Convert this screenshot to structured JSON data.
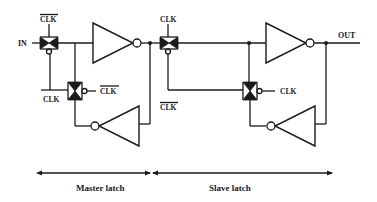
{
  "diagram": {
    "signals": {
      "input": "IN",
      "output": "OUT",
      "clk": "CLK",
      "clk_bar": "CLK"
    },
    "labels": {
      "tg1_clock": "CLK",
      "tg2_clock_left": "CLK",
      "tg2_clock_right": "CLK",
      "tg3_clock": "CLK",
      "tg3_clock_bar": "CLK",
      "tg4_clock": "CLK"
    },
    "sections": [
      {
        "label": "Master latch"
      },
      {
        "label": "Slave latch"
      }
    ],
    "components": [
      {
        "type": "transmission-gate",
        "id": "tg-master-input",
        "control": "CLK_bar (top) / CLK (bottom)"
      },
      {
        "type": "inverter",
        "id": "inv-master-forward"
      },
      {
        "type": "inverter",
        "id": "inv-master-feedback"
      },
      {
        "type": "transmission-gate",
        "id": "tg-master-feedback",
        "control": "CLK (left) / CLK_bar (right)"
      },
      {
        "type": "transmission-gate",
        "id": "tg-slave-input",
        "control": "CLK (top) / CLK_bar (bottom)"
      },
      {
        "type": "inverter",
        "id": "inv-slave-forward"
      },
      {
        "type": "inverter",
        "id": "inv-slave-feedback"
      },
      {
        "type": "transmission-gate",
        "id": "tg-slave-feedback",
        "control": "CLK (right)"
      }
    ],
    "colors": {
      "ink": "#1a1a1a",
      "background": "#ffffff"
    }
  }
}
